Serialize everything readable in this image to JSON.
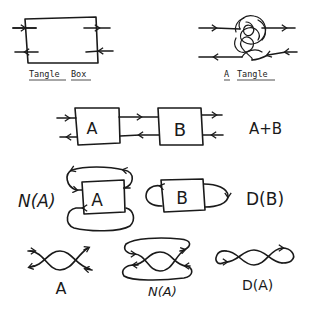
{
  "figure": {
    "panels": [
      {
        "id": "tangle-box",
        "caption_word1": "Tangle",
        "caption_word2": "Box"
      },
      {
        "id": "a-tangle",
        "caption_word1": "A",
        "caption_word2": "Tangle"
      },
      {
        "id": "sum",
        "box_left": "A",
        "box_right": "B",
        "label": "A+B"
      },
      {
        "id": "numerator",
        "box": "A",
        "label": "N(A)"
      },
      {
        "id": "denominator",
        "box": "B",
        "label": "D(B)"
      },
      {
        "id": "crossing",
        "label": "A"
      },
      {
        "id": "crossing-numerator",
        "label": "N(A)"
      },
      {
        "id": "crossing-denominator",
        "label": "D(A)"
      }
    ],
    "colors": {
      "ink": "#1a1a1a",
      "background": "#ffffff"
    }
  }
}
